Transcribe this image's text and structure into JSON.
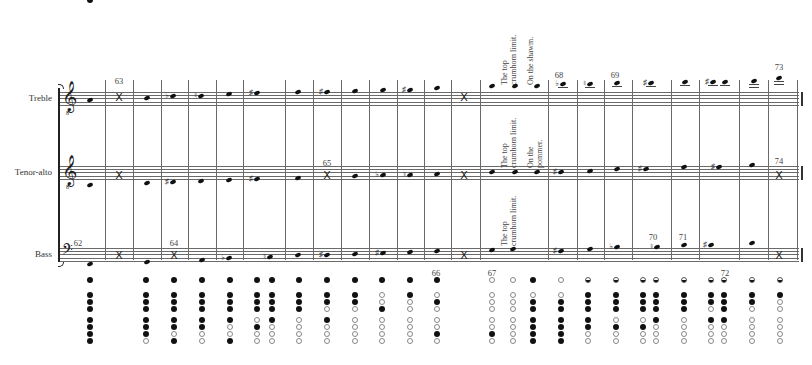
{
  "staves": [
    {
      "name": "Treble",
      "clef": "treble-8vb",
      "top": 92
    },
    {
      "name": "Tenor-alto",
      "clef": "treble-8vb",
      "top": 166
    },
    {
      "name": "Bass",
      "clef": "bass",
      "top": 248
    }
  ],
  "bracket": {
    "x": 58,
    "top": 88,
    "bottom": 262
  },
  "barlines_x": [
    105,
    133,
    161,
    188,
    216,
    243,
    285,
    313,
    341,
    369,
    397,
    424,
    451,
    480,
    548,
    577,
    604,
    632,
    671,
    699,
    739,
    768,
    797
  ],
  "bar_numbers": [
    {
      "text": "63",
      "x": 119,
      "y": 76
    },
    {
      "text": "65",
      "x": 327,
      "y": 158
    },
    {
      "text": "62",
      "x": 78,
      "y": 238
    },
    {
      "text": "64",
      "x": 174,
      "y": 238
    },
    {
      "text": "68",
      "x": 559,
      "y": 70
    },
    {
      "text": "69",
      "x": 615,
      "y": 70
    },
    {
      "text": "73",
      "x": 779,
      "y": 62
    },
    {
      "text": "74",
      "x": 779,
      "y": 156
    },
    {
      "text": "70",
      "x": 653,
      "y": 232
    },
    {
      "text": "71",
      "x": 683,
      "y": 232
    },
    {
      "text": "66",
      "x": 436,
      "y": 268
    },
    {
      "text": "67",
      "x": 492,
      "y": 268
    },
    {
      "text": "72",
      "x": 725,
      "y": 268
    }
  ],
  "annotations": [
    {
      "lines": [
        "The top",
        "crumhorn limit."
      ],
      "x": 507,
      "y": 5,
      "h": 80
    },
    {
      "lines": [
        "On the shawm."
      ],
      "x": 533,
      "y": 5,
      "h": 80
    },
    {
      "lines": [
        "The top",
        "crumhorn limit."
      ],
      "x": 507,
      "y": 110,
      "h": 58
    },
    {
      "lines": [
        "On the",
        "pommer."
      ],
      "x": 533,
      "y": 120,
      "h": 48
    },
    {
      "lines": [
        "The top",
        "crumhorn limit."
      ],
      "x": 507,
      "y": 198,
      "h": 48
    }
  ],
  "notes": {
    "Treble": [
      {
        "x": 90,
        "y": 100
      },
      {
        "x": 119,
        "type": "x",
        "y": 97
      },
      {
        "x": 147,
        "y": 98
      },
      {
        "x": 173,
        "y": 96,
        "acc": "♭"
      },
      {
        "x": 201,
        "y": 96,
        "acc": "♮"
      },
      {
        "x": 229,
        "y": 94
      },
      {
        "x": 257,
        "y": 93,
        "acc": "♯"
      },
      {
        "x": 298,
        "y": 92
      },
      {
        "x": 327,
        "y": 92,
        "acc": "♯"
      },
      {
        "x": 355,
        "y": 91
      },
      {
        "x": 383,
        "y": 90
      },
      {
        "x": 410,
        "y": 90,
        "acc": "♯"
      },
      {
        "x": 437,
        "y": 88
      },
      {
        "x": 464,
        "type": "x",
        "y": 97
      },
      {
        "x": 492,
        "y": 86
      },
      {
        "x": 515,
        "y": 86
      },
      {
        "x": 537,
        "y": 86
      },
      {
        "x": 563,
        "y": 84,
        "acc": "♭",
        "ledger": 1
      },
      {
        "x": 590,
        "y": 84,
        "acc": "♮",
        "ledger": 1
      },
      {
        "x": 617,
        "y": 83,
        "ledger": 1
      },
      {
        "x": 651,
        "y": 83,
        "acc": "♯",
        "ledger": 1
      },
      {
        "x": 685,
        "y": 82,
        "ledger": 1
      },
      {
        "x": 713,
        "y": 82,
        "acc": "♯",
        "ledger": 1
      },
      {
        "x": 725,
        "y": 82,
        "ledger": 1
      },
      {
        "x": 754,
        "y": 81,
        "ledger": 2
      },
      {
        "x": 779,
        "y": 78,
        "ledger": 2
      }
    ],
    "Tenor-alto": [
      {
        "x": 90,
        "y": 185
      },
      {
        "x": 119,
        "type": "x",
        "y": 175
      },
      {
        "x": 147,
        "y": 183
      },
      {
        "x": 173,
        "y": 182,
        "acc": "♯"
      },
      {
        "x": 201,
        "y": 181
      },
      {
        "x": 229,
        "y": 180
      },
      {
        "x": 257,
        "y": 179,
        "acc": "♯"
      },
      {
        "x": 298,
        "y": 178
      },
      {
        "x": 327,
        "type": "x",
        "y": 175
      },
      {
        "x": 355,
        "y": 176
      },
      {
        "x": 383,
        "y": 175,
        "acc": "♭"
      },
      {
        "x": 410,
        "y": 175,
        "acc": "♮"
      },
      {
        "x": 437,
        "y": 174
      },
      {
        "x": 464,
        "type": "x",
        "y": 175
      },
      {
        "x": 492,
        "y": 172
      },
      {
        "x": 515,
        "y": 172
      },
      {
        "x": 537,
        "y": 172
      },
      {
        "x": 561,
        "y": 172,
        "acc": "♯"
      },
      {
        "x": 590,
        "y": 171
      },
      {
        "x": 617,
        "y": 169
      },
      {
        "x": 646,
        "y": 169,
        "acc": "♯"
      },
      {
        "x": 684,
        "y": 167
      },
      {
        "x": 719,
        "y": 167,
        "acc": "♯"
      },
      {
        "x": 752,
        "y": 165
      },
      {
        "x": 779,
        "type": "x",
        "y": 175
      }
    ],
    "Bass": [
      {
        "x": 90,
        "y": 264
      },
      {
        "x": 119,
        "type": "x",
        "y": 255
      },
      {
        "x": 147,
        "y": 262
      },
      {
        "x": 174,
        "type": "x",
        "y": 255
      },
      {
        "x": 202,
        "y": 260
      },
      {
        "x": 229,
        "y": 258,
        "acc": "♭"
      },
      {
        "x": 270,
        "y": 257,
        "acc": "♮"
      },
      {
        "x": 298,
        "y": 255
      },
      {
        "x": 327,
        "y": 255,
        "acc": "♯"
      },
      {
        "x": 355,
        "y": 254
      },
      {
        "x": 383,
        "y": 253,
        "acc": "♯"
      },
      {
        "x": 410,
        "y": 252
      },
      {
        "x": 437,
        "y": 251
      },
      {
        "x": 464,
        "type": "x",
        "y": 255
      },
      {
        "x": 492,
        "y": 250
      },
      {
        "x": 513,
        "y": 249
      },
      {
        "x": 561,
        "y": 251,
        "acc": "♯"
      },
      {
        "x": 590,
        "y": 249
      },
      {
        "x": 617,
        "y": 247,
        "acc": "♭"
      },
      {
        "x": 657,
        "y": 247,
        "acc": "♮"
      },
      {
        "x": 684,
        "y": 245
      },
      {
        "x": 711,
        "y": 245,
        "acc": "♯"
      },
      {
        "x": 752,
        "y": 243
      },
      {
        "x": 779,
        "type": "x",
        "y": 255
      }
    ]
  },
  "fingering": {
    "row_y": [
      280,
      295,
      302,
      309,
      320,
      327,
      334,
      341
    ],
    "columns": [
      {
        "x": 90,
        "holes": "f ffff ffff"
      },
      {
        "x": 146,
        "holes": "f fff fffo"
      },
      {
        "x": 174,
        "holes": "f fff ffof"
      },
      {
        "x": 202,
        "holes": "f fff ffoo"
      },
      {
        "x": 230,
        "holes": "f fff foof"
      },
      {
        "x": 257,
        "holes": "f fff ofoo"
      },
      {
        "x": 272,
        "holes": "f fff fooo"
      },
      {
        "x": 299,
        "holes": "f fff oooo"
      },
      {
        "x": 327,
        "holes": "f ffo fooo"
      },
      {
        "x": 355,
        "holes": "f ffo oooo"
      },
      {
        "x": 382,
        "holes": "f oof oooo"
      },
      {
        "x": 410,
        "holes": "f foo oooo"
      },
      {
        "x": 437,
        "holes": "f ofo oofo"
      },
      {
        "x": 492,
        "holes": "o ooo oofo"
      },
      {
        "x": 513,
        "holes": "o ooo oooo"
      },
      {
        "x": 533,
        "holes": "f off ffff"
      },
      {
        "x": 561,
        "holes": "o off ffff"
      },
      {
        "x": 588,
        "holes": "h fff ffoo"
      },
      {
        "x": 616,
        "holes": "h fff ofoo"
      },
      {
        "x": 643,
        "holes": "h fff ofoo"
      },
      {
        "x": 656,
        "holes": "h fff fooo"
      },
      {
        "x": 684,
        "holes": "h fff oooo"
      },
      {
        "x": 711,
        "holes": "h ffo fooo"
      },
      {
        "x": 724,
        "holes": "h fff fooo"
      },
      {
        "x": 752,
        "holes": "h ffo oooo"
      },
      {
        "x": 780,
        "holes": "h foo oooo"
      }
    ]
  }
}
